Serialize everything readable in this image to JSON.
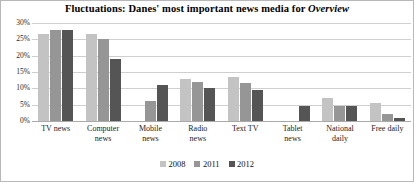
{
  "chart_data": {
    "type": "bar",
    "title": "Fluctuations: Danes' most important news media for Overview",
    "title_plain": "Fluctuations: Danes' most important news media for ",
    "title_emphasis": "Overview",
    "xlabel": "",
    "ylabel": "",
    "ylim": [
      0,
      30
    ],
    "yticks": [
      0,
      5,
      10,
      15,
      20,
      25,
      30
    ],
    "ytick_labels": [
      "0%",
      "5%",
      "10%",
      "15%",
      "20%",
      "25%",
      "30%"
    ],
    "grid": true,
    "legend_position": "bottom",
    "categories": [
      "TV news",
      "Computer news",
      "Mobile news",
      "Radio news",
      "Text TV",
      "Tablet news",
      "National daily",
      "Free daily"
    ],
    "category_lines": [
      [
        "TV news"
      ],
      [
        "Computer",
        "news"
      ],
      [
        "Mobile",
        "news"
      ],
      [
        "Radio",
        "news"
      ],
      [
        "Text TV"
      ],
      [
        "Tablet",
        "news"
      ],
      [
        "National",
        "daily"
      ],
      [
        "Free daily"
      ]
    ],
    "series": [
      {
        "name": "2008",
        "color": "#c3c3c3",
        "values": [
          26.5,
          26.5,
          0,
          13,
          13.5,
          0,
          7,
          5.5
        ]
      },
      {
        "name": "2011",
        "color": "#969696",
        "values": [
          28,
          25,
          6,
          12,
          11.5,
          0,
          4.5,
          2.2
        ]
      },
      {
        "name": "2012",
        "color": "#555555",
        "values": [
          28,
          19,
          11,
          10,
          9.5,
          4.5,
          4.5,
          0.8
        ]
      }
    ]
  }
}
